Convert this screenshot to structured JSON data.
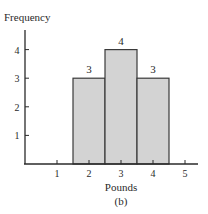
{
  "chart_data": {
    "type": "bar",
    "subtype": "histogram",
    "title": "",
    "caption": "(b)",
    "xlabel": "Pounds",
    "ylabel": "Frequency",
    "x_ticks": [
      "1",
      "2",
      "3",
      "4",
      "5"
    ],
    "y_ticks": [
      "1",
      "2",
      "3",
      "4"
    ],
    "categories": [
      "2",
      "3",
      "4"
    ],
    "bin_edges": [
      1.5,
      2.5,
      3.5,
      4.5
    ],
    "values": [
      3,
      4,
      3
    ],
    "data_labels": [
      "3",
      "4",
      "3"
    ],
    "xlim": [
      0,
      5.5
    ],
    "ylim": [
      0,
      4.8
    ],
    "grid": false,
    "legend": null,
    "colors": {
      "bar_fill": "#d3d3d3",
      "bar_edge": "#3a3a3a",
      "axis": "#2a2a2a"
    }
  }
}
